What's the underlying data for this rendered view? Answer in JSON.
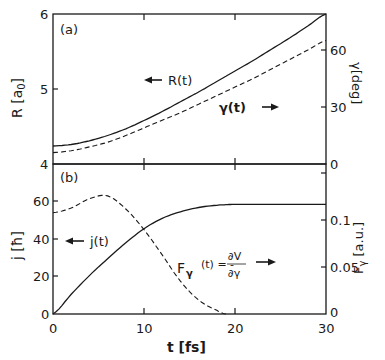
{
  "chart_data": [
    {
      "panel": "(a)",
      "type": "line",
      "x": [
        0,
        2,
        4,
        6,
        8,
        10,
        12,
        14,
        16,
        18,
        20,
        22,
        24,
        26,
        28,
        30
      ],
      "xlabel": "t [fs]",
      "xlim": [
        0,
        30
      ],
      "xticks": [
        0,
        10,
        20,
        30
      ],
      "ylabel_left": "R [a0]",
      "ylim_left": [
        4,
        6
      ],
      "yticks_left": [
        4,
        5,
        6
      ],
      "ylabel_right": "γ [deg]",
      "ylim_right": [
        0,
        79
      ],
      "yticks_right": [
        0,
        30,
        60
      ],
      "series": [
        {
          "name": "R(t)",
          "axis": "left",
          "style": "solid",
          "values": [
            4.24,
            4.26,
            4.31,
            4.38,
            4.47,
            4.58,
            4.7,
            4.83,
            4.96,
            5.1,
            5.24,
            5.38,
            5.53,
            5.68,
            5.84,
            6.0
          ]
        },
        {
          "name": "γ(t)",
          "axis": "right",
          "style": "dashed",
          "values": [
            6,
            7,
            9,
            11.5,
            15,
            19,
            23,
            27,
            31.5,
            36,
            40.5,
            45,
            50,
            55,
            60,
            65
          ]
        }
      ],
      "annotations": [
        {
          "text": "← R(t)"
        },
        {
          "text": "γ(t) →"
        }
      ]
    },
    {
      "panel": "(b)",
      "type": "line",
      "x": [
        0,
        2,
        4,
        6,
        8,
        10,
        12,
        14,
        16,
        18,
        19,
        20,
        22,
        24,
        26,
        28,
        30
      ],
      "xlabel": "t [fs]",
      "xlim": [
        0,
        30
      ],
      "xticks": [
        0,
        10,
        20,
        30
      ],
      "ylabel_left": "j [ħ]",
      "ylim_left": [
        0,
        80
      ],
      "yticks_left": [
        0,
        20,
        40,
        60
      ],
      "ylabel_right": "Fγ [a.u.]",
      "ylim_right": [
        0,
        0.16
      ],
      "yticks_right": [
        0,
        0.05,
        0.1
      ],
      "series": [
        {
          "name": "j(t)",
          "axis": "left",
          "style": "solid",
          "values": [
            0,
            10.5,
            20.5,
            29.5,
            38,
            45.5,
            51,
            54.5,
            56.8,
            58,
            58.3,
            58.5,
            58.5,
            58.5,
            58.5,
            58.5,
            58.5
          ]
        },
        {
          "name": "Fγ(t) = -∂V/∂γ",
          "axis": "right",
          "style": "dashed",
          "values": [
            0.108,
            0.113,
            0.123,
            0.126,
            0.112,
            0.09,
            0.063,
            0.035,
            0.015,
            0.004,
            0.0,
            null,
            null,
            null,
            null,
            null,
            null
          ]
        }
      ],
      "annotations": [
        {
          "text": "← j(t)"
        },
        {
          "text": "Fγ(t) = -∂V/∂γ →"
        }
      ]
    }
  ],
  "labels": {
    "panel_a": "(a)",
    "panel_b": "(b)",
    "r_label": "R(t)",
    "gamma_label": "γ(t)",
    "j_label": "j(t)",
    "f_label_main": "F",
    "f_label_sub": "γ",
    "f_label_eq": "(t) = -",
    "f_num": "∂V",
    "f_den": "∂γ",
    "xlabel": "t  [fs]",
    "ylabel_a_left": "R [a",
    "ylabel_a_left_sub": "0",
    "ylabel_a_left_end": "]",
    "ylabel_a_right": "γ[deg]",
    "ylabel_b_left": "j [ħ]",
    "ylabel_b_right": "F",
    "ylabel_b_right_sub": "γ",
    "ylabel_b_right_end": " [a.u.]",
    "ticks": {
      "x": [
        "0",
        "10",
        "20",
        "30"
      ],
      "a_left": [
        "6",
        "5",
        "4"
      ],
      "a_right": [
        "60",
        "30",
        "0"
      ],
      "b_left": [
        "60",
        "40",
        "20",
        "0"
      ],
      "b_right": [
        "0.1",
        "0.05",
        "0"
      ]
    }
  }
}
